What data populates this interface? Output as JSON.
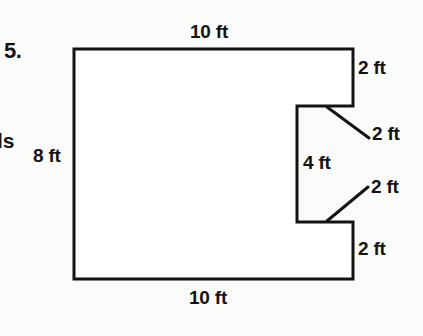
{
  "page": {
    "problem_number": "5.",
    "margin_fragment": "ls",
    "background_color": "#fbfbf9",
    "ink_color": "#131313"
  },
  "figure": {
    "shape_name": "notched-rectangle",
    "stroke_color": "#131313",
    "stroke_width": 3,
    "fill_color": "#ffffff",
    "outline_points": "74,49 353,49 353,106 297,106 297,222 353,222 353,279 74,279",
    "leader_lines": [
      {
        "name": "leader-upper-notch",
        "x1": 327,
        "y1": 107,
        "x2": 369,
        "y2": 138
      },
      {
        "name": "leader-lower-notch",
        "x1": 327,
        "y1": 221,
        "x2": 368,
        "y2": 187
      }
    ],
    "dimensions": {
      "top": "10 ft",
      "bottom": "10 ft",
      "left": "8 ft",
      "notch_height": "4 ft",
      "right_upper": "2 ft",
      "notch_top_depth": "2 ft",
      "notch_bottom_depth": "2 ft",
      "right_lower": "2 ft"
    }
  }
}
